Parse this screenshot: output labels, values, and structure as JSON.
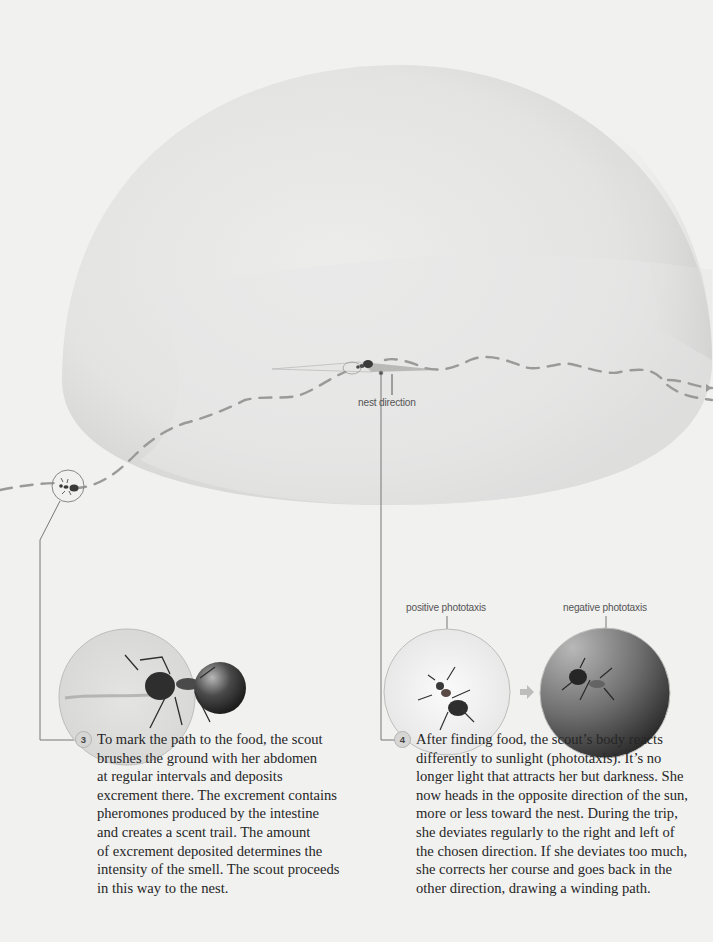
{
  "diagram": {
    "colors": {
      "background": "#f1f1f0",
      "dome": "#e4e4e3",
      "path": "#9a9a98",
      "leader_line": "#6a6a6a",
      "nest_direction_wedge": "#b9b9b8",
      "dark_circle": "#3a3a3a"
    },
    "labels": {
      "nest_direction": "nest direction",
      "positive_phototaxis": "positive phototaxis",
      "negative_phototaxis": "negative phototaxis"
    },
    "steps": [
      {
        "number": "3",
        "lines": [
          "To mark the path to the food, the scout",
          "brushes the ground with her abdomen",
          "at regular intervals and deposits",
          "excrement there. The excrement contains",
          "pheromones produced by the intestine",
          "and creates a scent trail. The amount",
          "of excrement deposited determines the",
          "intensity of the smell. The scout proceeds",
          "in this way to the nest."
        ]
      },
      {
        "number": "4",
        "lines": [
          "After finding food, the scout’s body reacts",
          "differently to sunlight (phototaxis). It’s no",
          "longer light that attracts her but darkness. She",
          "now heads in the opposite direction of the sun,",
          "more or less toward the nest. During the trip,",
          "she deviates regularly to the right and left of",
          "the chosen direction. If she deviates too much,",
          "she corrects her course and goes back in the",
          "other direction, drawing a winding path."
        ]
      }
    ],
    "icons": {
      "arrow": "right-arrow-icon"
    }
  }
}
